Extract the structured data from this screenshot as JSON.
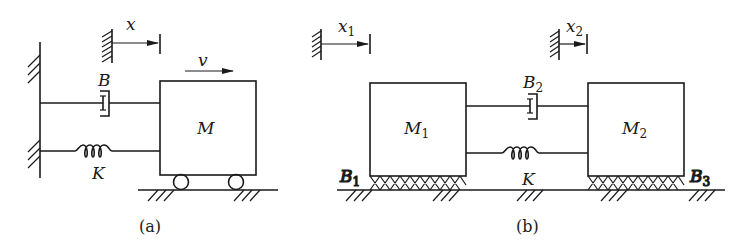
{
  "figure_a": {
    "caption": "(a)",
    "displacement_label": "x",
    "velocity_label": "v",
    "damper_label": "B",
    "spring_label": "K",
    "mass_label": "M"
  },
  "figure_b": {
    "caption": "(b)",
    "displacement_1_label": "x",
    "displacement_1_sub": "1",
    "displacement_2_label": "x",
    "displacement_2_sub": "2",
    "damper_label": "B",
    "damper_sub": "2",
    "spring_label": "K",
    "mass_1_label": "M",
    "mass_1_sub": "1",
    "mass_2_label": "M",
    "mass_2_sub": "2",
    "friction_1_label": "B",
    "friction_1_sub": "1",
    "friction_3_label": "B",
    "friction_3_sub": "3"
  }
}
